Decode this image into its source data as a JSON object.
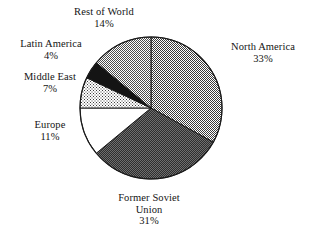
{
  "chart_data": {
    "type": "pie",
    "title": "",
    "subtitle": "",
    "xlabel": "",
    "ylabel": "",
    "legend_position": "none",
    "labels_position": "outside-callout",
    "grid": false,
    "start_angle_deg": 0,
    "direction": "clockwise",
    "categories": [
      "North America",
      "Former Soviet Union",
      "Europe",
      "Middle East",
      "Latin America",
      "Rest of World"
    ],
    "values": [
      33,
      31,
      11,
      7,
      4,
      14
    ],
    "value_unit": "%",
    "slices": [
      {
        "label": "North America",
        "label_line1": "North America",
        "label_line2": "",
        "percent": 33,
        "percent_text": "33%",
        "fill": "#9a9a9a",
        "pattern": "halftone-medium",
        "stroke": "#1a1a1a"
      },
      {
        "label": "Former Soviet Union",
        "label_line1": "Former Soviet",
        "label_line2": "Union",
        "percent": 31,
        "percent_text": "31%",
        "fill": "#4a4a4a",
        "pattern": "halftone-dark",
        "stroke": "#1a1a1a"
      },
      {
        "label": "Europe",
        "label_line1": "Europe",
        "label_line2": "",
        "percent": 11,
        "percent_text": "11%",
        "fill": "#ffffff",
        "pattern": "solid-white",
        "stroke": "#1a1a1a"
      },
      {
        "label": "Middle East",
        "label_line1": "Middle East",
        "label_line2": "",
        "percent": 7,
        "percent_text": "7%",
        "fill": "#c4c4c4",
        "pattern": "halftone-light",
        "stroke": "#1a1a1a"
      },
      {
        "label": "Latin America",
        "label_line1": "Latin America",
        "label_line2": "",
        "percent": 4,
        "percent_text": "4%",
        "fill": "#141414",
        "pattern": "solid-black",
        "stroke": "#1a1a1a"
      },
      {
        "label": "Rest of World",
        "label_line1": "Rest of World",
        "label_line2": "",
        "percent": 14,
        "percent_text": "14%",
        "fill": "#a8a8a8",
        "pattern": "halftone-medium-light",
        "stroke": "#1a1a1a"
      }
    ],
    "geometry": {
      "center_x": 151,
      "center_y": 108,
      "radius": 71
    },
    "colors": {
      "background": "#ffffff",
      "outline": "#1a1a1a",
      "text": "#141414"
    }
  }
}
